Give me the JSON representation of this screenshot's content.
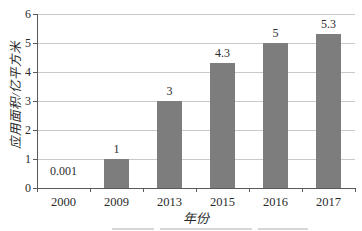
{
  "chart_data": {
    "type": "bar",
    "title": "",
    "categories": [
      "2000",
      "2009",
      "2013",
      "2015",
      "2016",
      "2017"
    ],
    "values": [
      0.001,
      1,
      3,
      4.3,
      5,
      5.3
    ],
    "data_labels": [
      "0.001",
      "1",
      "3",
      "4.3",
      "5",
      "5.3"
    ],
    "xlabel": "年份",
    "ylabel": "应用面积/亿平方米",
    "ylim": [
      0,
      6
    ],
    "ytick_interval": 1,
    "yticks": [
      "0",
      "1",
      "2",
      "3",
      "4",
      "5",
      "6"
    ],
    "grid": "horizontal",
    "legend": "none",
    "colors": {
      "bar": "#7d7d7d",
      "gridline": "#c9c9c9",
      "axis": "#5a5a5a",
      "text": "#2b2b2b",
      "background": "#ffffff"
    }
  }
}
